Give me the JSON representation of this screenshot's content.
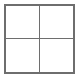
{
  "figure": {
    "name": "2x2-grid",
    "title": "",
    "rows": 2,
    "columns": 2,
    "background_color": "#ffffff",
    "border_color": "#6e6e6e",
    "cell_fill_color": "#ffffff",
    "outer_border_width_px": 2,
    "inner_divider_width_px": 1,
    "cells": [
      {
        "id": "cell-r1c1",
        "row": 1,
        "column": 1,
        "label": ""
      },
      {
        "id": "cell-r1c2",
        "row": 1,
        "column": 2,
        "label": ""
      },
      {
        "id": "cell-r2c1",
        "row": 2,
        "column": 1,
        "label": ""
      },
      {
        "id": "cell-r2c2",
        "row": 2,
        "column": 2,
        "label": ""
      }
    ]
  }
}
